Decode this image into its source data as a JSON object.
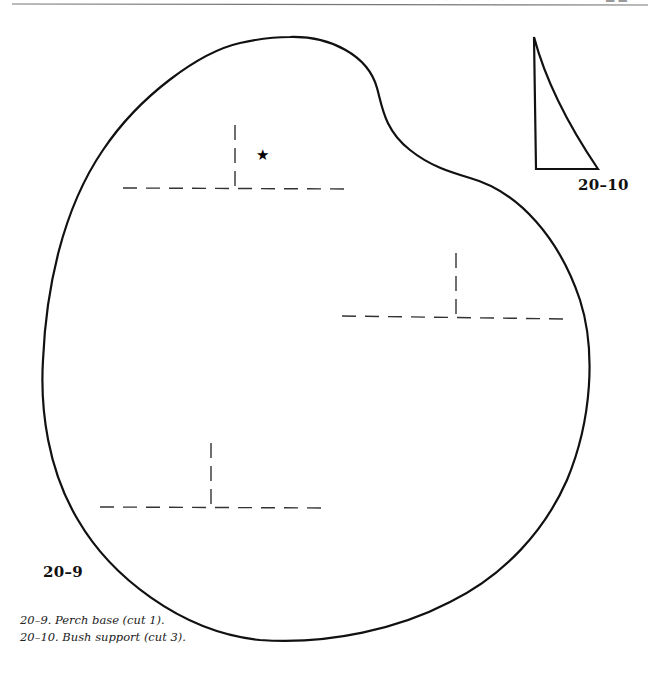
{
  "page": {
    "header_fragment_left": "• • • • • • •",
    "header_fragment_right": "▬▬"
  },
  "figures": {
    "perch_base": {
      "label": "20–9",
      "caption": "20–9.  Perch base (cut 1).",
      "marker": "★",
      "marker_icon": "star-icon"
    },
    "bush_support": {
      "label": "20–10",
      "caption": "20–10.  Bush support (cut 3)."
    }
  },
  "colors": {
    "line": "#111111",
    "dash": "#333333",
    "background": "#ffffff"
  }
}
